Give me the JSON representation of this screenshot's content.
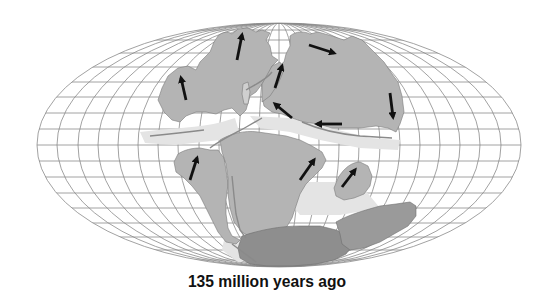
{
  "caption": "135 million years ago",
  "map": {
    "projection": "Mollweide-like elliptical world grid",
    "colors": {
      "background": "#ffffff",
      "grid": "#8a8a8a",
      "land": "#b4b4b4",
      "land_dark": "#8c8c8c",
      "shelf": "#e6e6e6",
      "arrow": "#111111",
      "rift": "#8a8a8a"
    },
    "landmasses": [
      "laurasia-north-america-europe",
      "laurasia-asia",
      "south-america",
      "africa",
      "india",
      "antarctica",
      "australia"
    ],
    "arrows": [
      {
        "name": "north-america-arrow",
        "from": [
          186,
          100
        ],
        "to": [
          180,
          75
        ]
      },
      {
        "name": "greenland-arrow",
        "from": [
          237,
          60
        ],
        "to": [
          243,
          32
        ]
      },
      {
        "name": "europe-arrow",
        "from": [
          275,
          88
        ],
        "to": [
          283,
          63
        ]
      },
      {
        "name": "siberia-arrow",
        "from": [
          309,
          45
        ],
        "to": [
          337,
          54
        ]
      },
      {
        "name": "east-asia-arrow",
        "from": [
          390,
          93
        ],
        "to": [
          393,
          120
        ]
      },
      {
        "name": "tethys-arrow",
        "from": [
          342,
          124
        ],
        "to": [
          314,
          124
        ]
      },
      {
        "name": "central-asia-arrow",
        "from": [
          292,
          118
        ],
        "to": [
          273,
          102
        ]
      },
      {
        "name": "south-america-arrow",
        "from": [
          190,
          180
        ],
        "to": [
          198,
          155
        ]
      },
      {
        "name": "africa-arrow",
        "from": [
          300,
          180
        ],
        "to": [
          316,
          157
        ]
      },
      {
        "name": "india-arrow",
        "from": [
          342,
          187
        ],
        "to": [
          357,
          168
        ]
      }
    ]
  }
}
